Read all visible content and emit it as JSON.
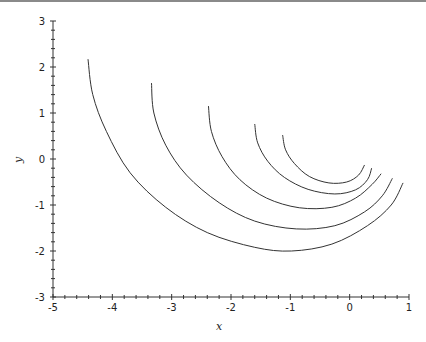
{
  "chart_data": {
    "type": "line",
    "title": "",
    "xlabel": "x",
    "ylabel": "y",
    "xlim": [
      -5,
      1
    ],
    "ylim": [
      -3,
      3
    ],
    "x_ticks": [
      -5,
      -4,
      -3,
      -2,
      -1,
      0,
      1
    ],
    "y_ticks": [
      -3,
      -2,
      -1,
      0,
      1,
      2,
      3
    ],
    "x_tick_labels": [
      "-5",
      "-4",
      "-3",
      "-2",
      "-1",
      "0",
      "1"
    ],
    "y_tick_labels": [
      "-3",
      "-2",
      "-1",
      "0",
      "1",
      "2",
      "3"
    ],
    "minor_ticks_per_major": 4,
    "grid": false,
    "legend": null,
    "line_color": "#333333",
    "series": [
      {
        "name": "curve-1",
        "points": [
          [
            -4.41,
            2.17
          ],
          [
            -4.33,
            1.4
          ],
          [
            -4.1,
            0.6
          ],
          [
            -3.7,
            -0.3
          ],
          [
            -3.1,
            -1.05
          ],
          [
            -2.4,
            -1.6
          ],
          [
            -1.6,
            -1.92
          ],
          [
            -0.98,
            -2.0
          ],
          [
            -0.3,
            -1.85
          ],
          [
            0.3,
            -1.45
          ],
          [
            0.7,
            -1.0
          ],
          [
            0.9,
            -0.52
          ]
        ]
      },
      {
        "name": "curve-2",
        "points": [
          [
            -3.34,
            1.65
          ],
          [
            -3.3,
            1.0
          ],
          [
            -3.1,
            0.3
          ],
          [
            -2.75,
            -0.35
          ],
          [
            -2.2,
            -0.95
          ],
          [
            -1.6,
            -1.35
          ],
          [
            -0.9,
            -1.52
          ],
          [
            -0.25,
            -1.45
          ],
          [
            0.25,
            -1.15
          ],
          [
            0.55,
            -0.8
          ],
          [
            0.72,
            -0.42
          ]
        ]
      },
      {
        "name": "curve-3",
        "points": [
          [
            -2.38,
            1.15
          ],
          [
            -2.33,
            0.6
          ],
          [
            -2.15,
            0.05
          ],
          [
            -1.85,
            -0.45
          ],
          [
            -1.4,
            -0.85
          ],
          [
            -0.85,
            -1.06
          ],
          [
            -0.3,
            -1.05
          ],
          [
            0.1,
            -0.85
          ],
          [
            0.38,
            -0.55
          ],
          [
            0.53,
            -0.32
          ]
        ]
      },
      {
        "name": "curve-4",
        "points": [
          [
            -1.6,
            0.76
          ],
          [
            -1.55,
            0.35
          ],
          [
            -1.38,
            -0.05
          ],
          [
            -1.1,
            -0.4
          ],
          [
            -0.7,
            -0.66
          ],
          [
            -0.25,
            -0.76
          ],
          [
            0.1,
            -0.67
          ],
          [
            0.3,
            -0.45
          ],
          [
            0.37,
            -0.2
          ]
        ]
      },
      {
        "name": "curve-5",
        "points": [
          [
            -1.13,
            0.52
          ],
          [
            -1.08,
            0.2
          ],
          [
            -0.93,
            -0.1
          ],
          [
            -0.68,
            -0.38
          ],
          [
            -0.35,
            -0.52
          ],
          [
            -0.05,
            -0.5
          ],
          [
            0.15,
            -0.35
          ],
          [
            0.25,
            -0.13
          ]
        ]
      }
    ]
  },
  "plot_frame": {
    "x0_px": 53,
    "x1_px": 409,
    "y0_px": 297,
    "y1_px": 21
  }
}
